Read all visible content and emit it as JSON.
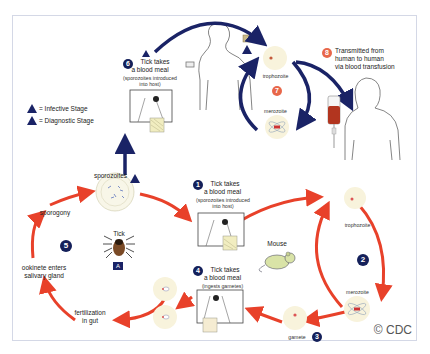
{
  "diagram": {
    "copyright": "© CDC",
    "legend": {
      "infective": {
        "symbol": "i",
        "label": "= Infective Stage"
      },
      "diagnostic": {
        "symbol": "d",
        "label": "= Diagnostic Stage"
      }
    },
    "steps": {
      "s1": {
        "num": "1",
        "line1": "Tick takes",
        "line2": "a blood meal",
        "line3": "(sporozoites introduced",
        "line4": "into host)"
      },
      "s2": {
        "num": "2"
      },
      "s3": {
        "num": "3",
        "label": "gamete"
      },
      "s4": {
        "num": "4",
        "line1": "Tick takes",
        "line2": "a blood meal",
        "line3": "(ingests gametes)"
      },
      "s5": {
        "num": "5"
      },
      "s6": {
        "num": "6",
        "line1": "Tick takes",
        "line2": "a blood meal",
        "line3": "(sporozoites introduced",
        "line4": "into host)"
      },
      "s7": {
        "num": "7"
      },
      "s8": {
        "num": "8",
        "line1": "Transmitted from",
        "line2": "human to human",
        "line3": "via blood transfusion"
      }
    },
    "stage_labels": {
      "sporozoites": "sporozoites",
      "sporogony": "sporogony",
      "ookinete_line1": "ookinete enters",
      "ookinete_line2": "salivary gland",
      "fertilization_line1": "fertilization",
      "fertilization_line2": "in gut",
      "tick": "Tick",
      "tick_badge": "A",
      "mouse": "Mouse",
      "trophozoite_mouse": "trophozoite",
      "merozoite_mouse": "merozoite",
      "trophozoite_human": "trophozoite",
      "merozoite_human": "merozoite",
      "human_badge": "B"
    },
    "colors": {
      "human_cycle_arrow": "#1a2366",
      "tick_cycle_arrow": "#e8412a",
      "step_badge": "#14205a",
      "human_step_badge": "#e8674a",
      "cell_fill": "#f8f3dc"
    }
  }
}
